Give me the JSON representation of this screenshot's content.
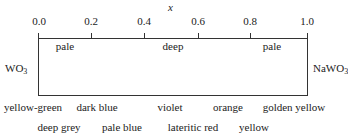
{
  "diagram": {
    "axis_label": "x",
    "ticks": [
      "0.0",
      "0.2",
      "0.4",
      "0.6",
      "0.8",
      "1.0"
    ],
    "regions": [
      "pale",
      "deep",
      "pale"
    ],
    "left_end": {
      "formula": "WO",
      "sub": "3"
    },
    "right_end": {
      "formula": "NaWO",
      "sub": "3"
    },
    "colors_row1": [
      "yellow-green",
      "dark blue",
      "violet",
      "orange",
      "golden yellow"
    ],
    "colors_row2": [
      "deep grey",
      "pale blue",
      "lateritic red",
      "yellow"
    ]
  }
}
